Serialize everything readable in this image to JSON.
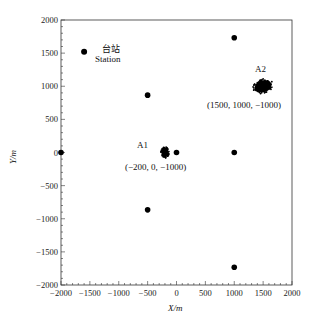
{
  "chart_data": {
    "type": "scatter",
    "title": "",
    "xlabel": "X/m",
    "ylabel": "Y/m",
    "xlim": [
      -2000,
      2000
    ],
    "ylim": [
      -2000,
      2000
    ],
    "xticks": [
      -2000,
      -1500,
      -1000,
      -500,
      0,
      500,
      1000,
      1500,
      2000
    ],
    "yticks": [
      -2000,
      -1500,
      -1000,
      -500,
      0,
      500,
      1000,
      1500,
      2000
    ],
    "xtick_labels": [
      "−2000",
      "−1500",
      "−1000",
      "−500",
      "0",
      "500",
      "1000",
      "1500",
      "2000"
    ],
    "ytick_labels": [
      "−2000",
      "−1500",
      "−1000",
      "−500",
      "0",
      "500",
      "1000",
      "1500",
      "2000"
    ],
    "grid": false,
    "legend": null,
    "station": {
      "x": -1600,
      "y": 1520,
      "label_cn": "台站",
      "label_en": "Station"
    },
    "sensors": [
      {
        "x": -2000,
        "y": 0
      },
      {
        "x": -500,
        "y": 866
      },
      {
        "x": -500,
        "y": -866
      },
      {
        "x": 0,
        "y": 0
      },
      {
        "x": 1000,
        "y": 1732
      },
      {
        "x": 1000,
        "y": 0
      },
      {
        "x": 1000,
        "y": -1732
      }
    ],
    "clusters": [
      {
        "name": "A1",
        "center": [
          -200,
          0
        ],
        "coords_label": "(−200, 0, −1000)",
        "spread_x": 60,
        "spread_y": 70
      },
      {
        "name": "A2",
        "center": [
          1500,
          1000
        ],
        "coords_label": "(1500, 1000, −1000)",
        "spread_x": 150,
        "spread_y": 90
      }
    ]
  }
}
